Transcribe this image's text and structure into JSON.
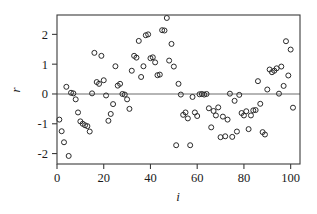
{
  "chart_data": {
    "type": "scatter",
    "title": "",
    "xlabel": "i",
    "ylabel": "r",
    "xlim": [
      0,
      104
    ],
    "ylim": [
      -2.35,
      2.65
    ],
    "xticks": [
      0,
      20,
      40,
      60,
      80,
      100
    ],
    "xtick_labels": [
      "0",
      "20",
      "40",
      "60",
      "80",
      "100"
    ],
    "yticks": [
      -2,
      -1,
      0,
      1,
      2
    ],
    "ytick_labels": [
      "-2",
      "-1",
      "0",
      "1",
      "2"
    ],
    "grid": false,
    "legend": null,
    "marker": "open-circle",
    "marker_color": "#2a2a2a",
    "reference_line": {
      "orientation": "horizontal",
      "value": 0,
      "color": "#6d6d6d"
    },
    "frame_color": "#3b3b3b",
    "background_color": "#ffffff",
    "n_points": 101,
    "x": [
      1,
      2,
      3,
      4,
      5,
      6,
      7,
      8,
      9,
      10,
      11,
      12,
      13,
      14,
      15,
      16,
      17,
      18,
      19,
      20,
      21,
      22,
      23,
      24,
      25,
      26,
      27,
      28,
      29,
      30,
      31,
      32,
      33,
      34,
      35,
      36,
      37,
      38,
      39,
      40,
      41,
      42,
      43,
      44,
      45,
      46,
      47,
      48,
      49,
      50,
      51,
      52,
      53,
      54,
      55,
      56,
      57,
      58,
      59,
      60,
      61,
      62,
      63,
      64,
      65,
      66,
      67,
      68,
      69,
      70,
      71,
      72,
      73,
      74,
      75,
      76,
      77,
      78,
      79,
      80,
      81,
      82,
      83,
      84,
      85,
      86,
      87,
      88,
      89,
      90,
      91,
      92,
      93,
      94,
      95,
      96,
      97,
      98,
      99,
      100,
      101
    ],
    "y": [
      -0.86,
      -1.25,
      -1.62,
      0.24,
      -2.08,
      0.04,
      0.02,
      -0.18,
      -0.62,
      -0.92,
      -1.0,
      -1.05,
      -1.08,
      -1.26,
      0.02,
      1.38,
      0.4,
      0.34,
      1.28,
      0.46,
      -0.05,
      -0.9,
      -0.67,
      -0.34,
      0.93,
      0.28,
      0.34,
      0.0,
      -0.02,
      -0.18,
      -0.5,
      0.78,
      1.28,
      1.22,
      1.78,
      0.57,
      0.93,
      1.97,
      2.0,
      1.2,
      1.23,
      1.06,
      0.63,
      0.65,
      2.14,
      2.13,
      2.55,
      1.12,
      1.68,
      0.92,
      -1.72,
      0.34,
      -0.02,
      -0.7,
      -0.62,
      -0.82,
      -1.72,
      -0.1,
      -0.62,
      -0.74,
      -0.01,
      0.0,
      -0.02,
      0.0,
      -0.48,
      -1.12,
      -0.57,
      -0.72,
      -0.45,
      -1.45,
      -0.76,
      -1.42,
      -0.86,
      0.01,
      -1.44,
      -0.23,
      -1.26,
      -0.03,
      -0.64,
      -0.72,
      -0.58,
      -1.18,
      -0.72,
      -0.55,
      -0.54,
      0.43,
      -0.33,
      -1.28,
      -1.36,
      0.15,
      0.82,
      0.73,
      0.78,
      0.86,
      0.01,
      0.92,
      0.27,
      1.77,
      0.62,
      1.49,
      -0.46
    ]
  },
  "axis": {
    "y_title": "r",
    "x_title": "i"
  }
}
